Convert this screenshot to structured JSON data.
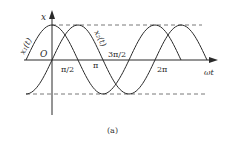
{
  "diagram": {
    "caption": "(a)",
    "axes": {
      "y_label": "x",
      "x_label": "ωt",
      "origin_label": "O"
    },
    "x_ticks": [
      "π/2",
      "π",
      "3π/2",
      "2π"
    ],
    "curves": [
      {
        "name": "x1(t)",
        "label": "x₁(t)",
        "function": "A·cos(ωt)"
      },
      {
        "name": "x2(t)",
        "label": "x₂(t)",
        "function": "A·sin(ωt)"
      }
    ],
    "reference_lines": [
      "+A (dashed)",
      "-A (dashed)"
    ],
    "colors": {
      "stroke": "#2a2a2a",
      "dashed": "#555555"
    }
  }
}
